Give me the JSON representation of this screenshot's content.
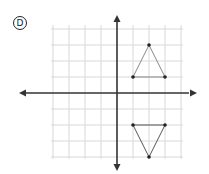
{
  "option_label": "D",
  "grid": {
    "origin_px": [
      117,
      93
    ],
    "unit_px": 16,
    "x_range": [
      -4,
      4
    ],
    "y_range": [
      -4,
      4
    ],
    "grid_color": "#d8d8d8",
    "axis_color": "#333333"
  },
  "shapes": [
    {
      "name": "triangle-upper",
      "vertices": [
        [
          1,
          1
        ],
        [
          2,
          3
        ],
        [
          3,
          1
        ]
      ],
      "color": "#888888"
    },
    {
      "name": "triangle-lower",
      "vertices": [
        [
          1,
          -2
        ],
        [
          3,
          -2
        ],
        [
          2,
          -4
        ]
      ],
      "color": "#555555"
    }
  ]
}
